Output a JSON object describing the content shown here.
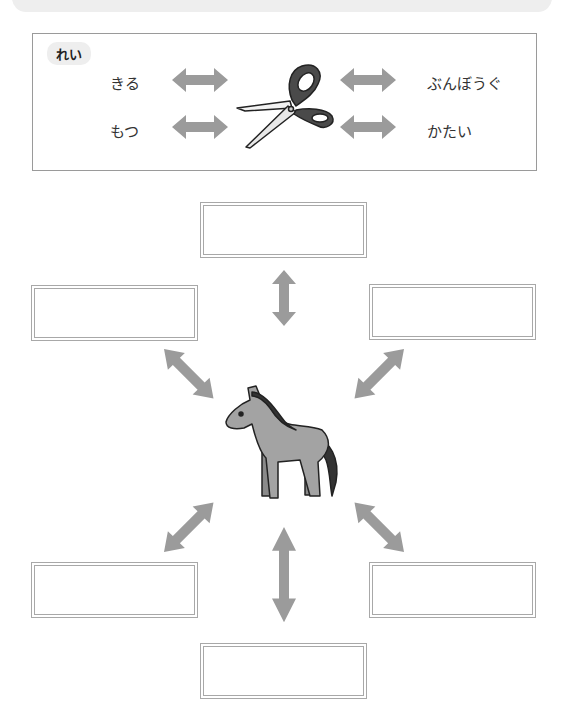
{
  "header": {
    "shape": "rounded-gray-strip"
  },
  "example": {
    "badge_label": "れい",
    "center_icon": "scissors-icon",
    "words": {
      "top_left": "きる",
      "bottom_left": "もつ",
      "top_right": "ぶんぼうぐ",
      "bottom_right": "かたい"
    }
  },
  "exercise": {
    "center_icon": "horse-icon",
    "answer_boxes": [
      {
        "position": "top",
        "value": ""
      },
      {
        "position": "upper-left",
        "value": ""
      },
      {
        "position": "upper-right",
        "value": ""
      },
      {
        "position": "lower-left",
        "value": ""
      },
      {
        "position": "lower-right",
        "value": ""
      },
      {
        "position": "bottom",
        "value": ""
      }
    ]
  },
  "colors": {
    "arrow": "#9b9b9b",
    "box_border": "#a8a8a8",
    "horse_body": "#a3a3a3",
    "scissors_handle": "#4a4a4a"
  }
}
